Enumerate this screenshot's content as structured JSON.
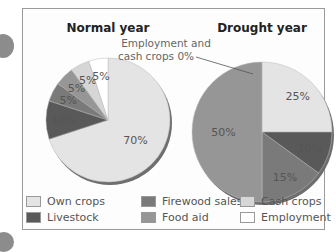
{
  "chart_data": [
    {
      "type": "pie",
      "title": "Normal year",
      "categories": [
        "Own crops",
        "Livestock",
        "Firewood sales",
        "Food aid",
        "Cash crops",
        "Employment"
      ],
      "values": [
        70,
        10,
        5,
        5,
        5,
        5
      ],
      "labels": [
        "70%",
        "10%",
        "5%",
        "5%",
        "5%",
        "5%"
      ]
    },
    {
      "type": "pie",
      "title": "Drought year",
      "categories": [
        "Own crops",
        "Livestock",
        "Firewood sales",
        "Food aid",
        "Cash crops",
        "Employment"
      ],
      "values": [
        25,
        10,
        15,
        50,
        0,
        0
      ],
      "labels": [
        "25%",
        "10%",
        "15%",
        "50%",
        "",
        ""
      ],
      "annotation": "Employment and cash crops 0%",
      "annotation_lines": [
        "Employment and",
        "cash crops 0%"
      ]
    }
  ],
  "legend": [
    {
      "label": "Own crops",
      "color": "#e4e4e4"
    },
    {
      "label": "Livestock",
      "color": "#595959"
    },
    {
      "label": "Firewood sales",
      "color": "#7a7a7a"
    },
    {
      "label": "Food aid",
      "color": "#969696"
    },
    {
      "label": "Cash crops",
      "color": "#d6d6d6"
    },
    {
      "label": "Employment",
      "color": "#ffffff"
    }
  ]
}
